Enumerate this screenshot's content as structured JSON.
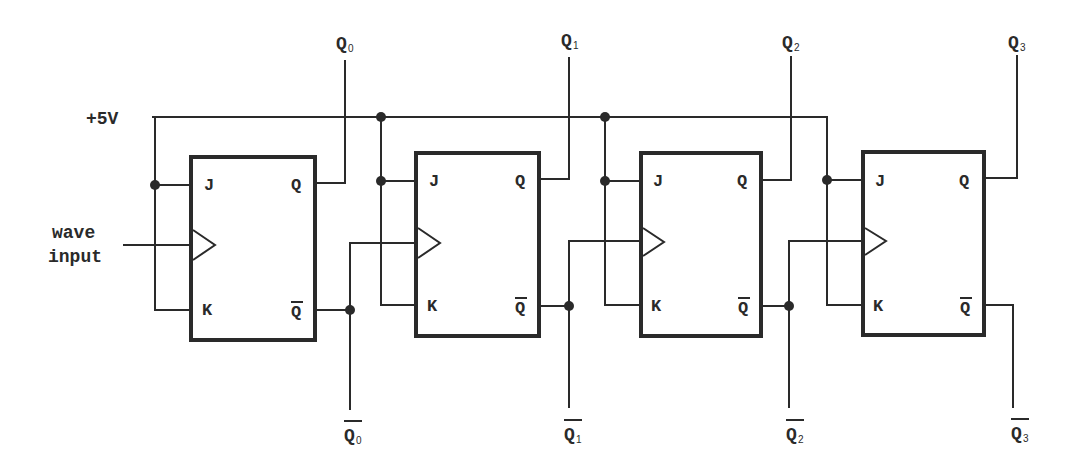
{
  "diagram": {
    "supply_label": "+5V",
    "input_label_line1": "wave",
    "input_label_line2": "input",
    "flip_flops": [
      {
        "j": "J",
        "k": "K",
        "q": "Q",
        "qbar": "Q",
        "out_q": "Q",
        "out_q_sub": "0",
        "out_qbar": "Q",
        "out_qbar_sub": "0"
      },
      {
        "j": "J",
        "k": "K",
        "q": "Q",
        "qbar": "Q",
        "out_q": "Q",
        "out_q_sub": "1",
        "out_qbar": "Q",
        "out_qbar_sub": "1"
      },
      {
        "j": "J",
        "k": "K",
        "q": "Q",
        "qbar": "Q",
        "out_q": "Q",
        "out_q_sub": "2",
        "out_qbar": "Q",
        "out_qbar_sub": "2"
      },
      {
        "j": "J",
        "k": "K",
        "q": "Q",
        "qbar": "Q",
        "out_q": "Q",
        "out_q_sub": "3",
        "out_qbar": "Q",
        "out_qbar_sub": "3"
      }
    ],
    "colors": {
      "line": "#2a2a2a",
      "background": "#ffffff"
    }
  }
}
